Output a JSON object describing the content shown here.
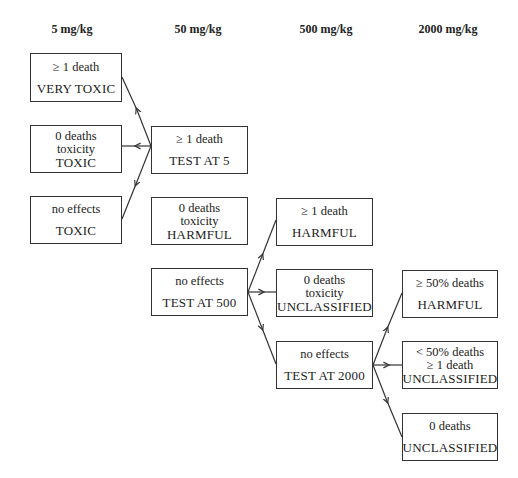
{
  "headers": [
    "5 mg/kg",
    "50 mg/kg",
    "500 mg/kg",
    "2000 mg/kg"
  ],
  "boxes": {
    "c1_very_toxic": {
      "lines": [
        "≥ 1 death",
        "VERY TOXIC"
      ]
    },
    "c1_toxic_0deaths": {
      "lines": [
        "0 deaths",
        "toxicity",
        "TOXIC"
      ]
    },
    "c1_toxic_noeffects": {
      "lines": [
        "no effects",
        "TOXIC"
      ]
    },
    "c2_test_at_5": {
      "lines": [
        "≥ 1 death",
        "TEST AT 5"
      ]
    },
    "c2_harmful": {
      "lines": [
        "0 deaths",
        "toxicity",
        "HARMFUL"
      ]
    },
    "c2_test_at_500": {
      "lines": [
        "no effects",
        "TEST AT 500"
      ]
    },
    "c3_harmful": {
      "lines": [
        "≥ 1 death",
        "HARMFUL"
      ]
    },
    "c3_unclassified": {
      "lines": [
        "0 deaths",
        "toxicity",
        "UNCLASSIFIED"
      ]
    },
    "c3_test_at_2000": {
      "lines": [
        "no effects",
        "TEST AT 2000"
      ]
    },
    "c4_harmful": {
      "lines": [
        "≥ 50% deaths",
        "HARMFUL"
      ]
    },
    "c4_unclassified_lt50": {
      "lines": [
        "< 50% deaths",
        "≥ 1 death",
        "UNCLASSIFIED"
      ]
    },
    "c4_unclassified_0": {
      "lines": [
        "0 deaths",
        "UNCLASSIFIED"
      ]
    }
  },
  "edges": [
    {
      "from": "c2_test_at_5",
      "to": "c1_very_toxic"
    },
    {
      "from": "c2_test_at_5",
      "to": "c1_toxic_0deaths"
    },
    {
      "from": "c2_test_at_5",
      "to": "c1_toxic_noeffects"
    },
    {
      "from": "c2_test_at_500",
      "to": "c3_harmful"
    },
    {
      "from": "c2_test_at_500",
      "to": "c3_unclassified"
    },
    {
      "from": "c2_test_at_500",
      "to": "c3_test_at_2000"
    },
    {
      "from": "c3_test_at_2000",
      "to": "c4_harmful"
    },
    {
      "from": "c3_test_at_2000",
      "to": "c4_unclassified_lt50"
    },
    {
      "from": "c3_test_at_2000",
      "to": "c4_unclassified_0"
    }
  ]
}
